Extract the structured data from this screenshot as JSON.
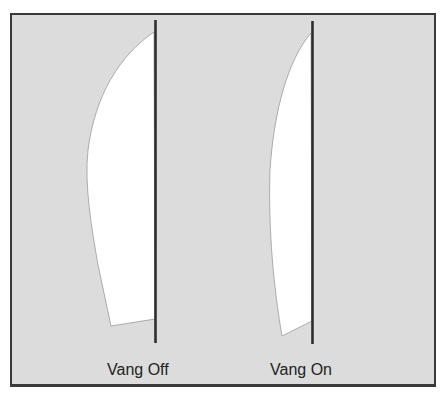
{
  "diagram": {
    "background_color": "#dcdcdc",
    "frame_color": "#3a3a3a",
    "sail_color": "#ffffff",
    "mast_color": "#2e2e2e",
    "panels": [
      {
        "label": "Vang Off",
        "description": "Mainsail with vang off: leech sags outward, boom lifts"
      },
      {
        "label": "Vang On",
        "description": "Mainsail with vang on: flatter leech, boom pulled down"
      }
    ]
  }
}
